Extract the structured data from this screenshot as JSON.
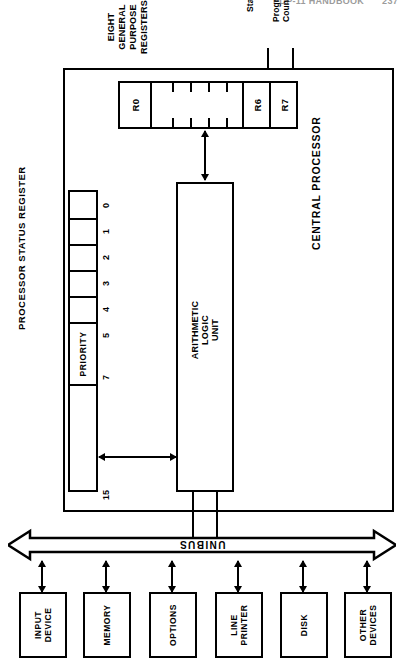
{
  "running_head": {
    "title": "PDP-11 HANDBOOK",
    "page": "237"
  },
  "diagram": {
    "cpu": {
      "label": "CENTRAL PROCESSOR"
    },
    "register_bank": {
      "label": "EIGHT GENERAL\nPURPOSE REGISTERS",
      "registers": [
        {
          "name": "R0",
          "labeled": true
        },
        {
          "name": "R1-R5",
          "labeled": false
        },
        {
          "name": "R6",
          "labeled": true
        },
        {
          "name": "R7",
          "labeled": true
        }
      ],
      "tick_count": 4
    },
    "pointers": [
      {
        "label": "Stack Pointer",
        "target": "R6"
      },
      {
        "label": "Program\nCounter",
        "target": "R7"
      }
    ],
    "psr": {
      "label": "PROCESSOR STATUS REGISTER",
      "priority_label": "PRIORITY",
      "bit_labels": [
        "0",
        "1",
        "2",
        "3",
        "4",
        "5",
        "7",
        "15"
      ]
    },
    "alu": {
      "label": "ARITHMETIC\nLOGIC\nUNIT"
    },
    "bus": {
      "label": "UNIBUS",
      "label_rotated": true
    },
    "devices": [
      {
        "label": "INPUT\nDEVICE"
      },
      {
        "label": "MEMORY"
      },
      {
        "label": "OPTIONS"
      },
      {
        "label": "LINE\nPRINTER"
      },
      {
        "label": "DISK"
      },
      {
        "label": "OTHER\nDEVICES"
      }
    ],
    "colors": {
      "ink": "#000000",
      "paper": "#ffffff"
    }
  }
}
